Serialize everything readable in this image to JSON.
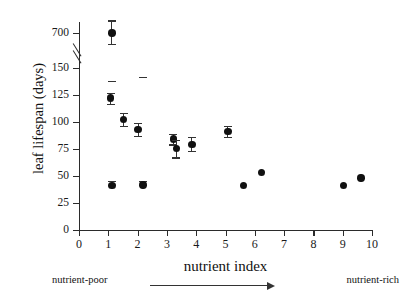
{
  "chart_data": {
    "type": "scatter",
    "title": "",
    "xlabel": "nutrient index",
    "ylabel": "leaf lifespan (days)",
    "xlim": [
      0,
      10
    ],
    "ylim": [
      0,
      150
    ],
    "grid": false,
    "legend": null,
    "y_axis_broken": true,
    "y_break_note": "axis break between 150 and 700",
    "x_ticks": [
      "0",
      "1",
      "2",
      "3",
      "4",
      "5",
      "6",
      "7",
      "8",
      "9",
      "10"
    ],
    "y_ticks": [
      "0",
      "25",
      "50",
      "75",
      "100",
      "125",
      "150",
      "700"
    ],
    "marker_color": "#111111",
    "errorbar_color": "#333333",
    "annotations": {
      "left": "nutrient-poor",
      "right": "nutrient-rich",
      "arrow": "arrow-right"
    },
    "points": [
      {
        "x": 1.12,
        "y": 700,
        "yerr_low": 660,
        "yerr_high": 745,
        "has_error": true
      },
      {
        "x": 1.12,
        "y": 155,
        "yerr_low": 138,
        "yerr_high": 172,
        "has_error": true
      },
      {
        "x": 1.08,
        "y": 122,
        "yerr_low": 117,
        "yerr_high": 127,
        "has_error": true
      },
      {
        "x": 1.52,
        "y": 102,
        "yerr_low": 96,
        "yerr_high": 108,
        "has_error": true
      },
      {
        "x": 2.02,
        "y": 93,
        "yerr_low": 87,
        "yerr_high": 99,
        "has_error": true
      },
      {
        "x": 2.18,
        "y": 157,
        "yerr_low": 142,
        "yerr_high": 172,
        "has_error": true
      },
      {
        "x": 3.22,
        "y": 84,
        "yerr_low": 79,
        "yerr_high": 89,
        "has_error": true
      },
      {
        "x": 3.32,
        "y": 75,
        "yerr_low": 67,
        "yerr_high": 83,
        "has_error": true
      },
      {
        "x": 3.85,
        "y": 79,
        "yerr_low": 73,
        "yerr_high": 86,
        "has_error": true
      },
      {
        "x": 5.08,
        "y": 91,
        "yerr_low": 86,
        "yerr_high": 96,
        "has_error": true
      },
      {
        "x": 5.62,
        "y": 41,
        "has_error": false
      },
      {
        "x": 6.22,
        "y": 53,
        "has_error": false
      },
      {
        "x": 9.02,
        "y": 41,
        "has_error": false
      },
      {
        "x": 9.62,
        "y": 48,
        "has_error": false
      }
    ]
  }
}
